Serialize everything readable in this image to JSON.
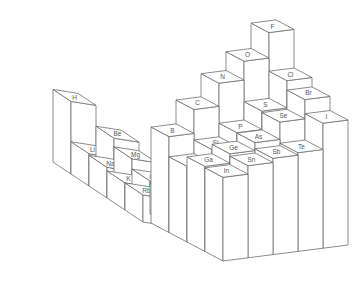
{
  "chart_data": {
    "type": "bar3d",
    "title": "",
    "quantity": "Electronegativity (Pauling scale, implied by bar heights)",
    "grid": false,
    "legend": null,
    "blocks": [
      {
        "name": "s-block",
        "columns": [
          "Group 1",
          "Group 2"
        ],
        "rows": [
          "Period 1",
          "Period 2",
          "Period 3",
          "Period 4",
          "Period 5"
        ],
        "bars": [
          {
            "symbol": "H",
            "row": 0,
            "col": 0,
            "value": 2.2
          },
          {
            "symbol": "Li",
            "row": 1,
            "col": 0,
            "value": 0.98
          },
          {
            "symbol": "Be",
            "row": 1,
            "col": 1,
            "value": 1.57
          },
          {
            "symbol": "Na",
            "row": 2,
            "col": 0,
            "value": 0.93
          },
          {
            "symbol": "Mg",
            "row": 2,
            "col": 1,
            "value": 1.31
          },
          {
            "symbol": "K",
            "row": 3,
            "col": 0,
            "value": 0.82
          },
          {
            "symbol": "Ca",
            "row": 3,
            "col": 1,
            "value": 1.0
          },
          {
            "symbol": "Rb",
            "row": 4,
            "col": 0,
            "value": 0.82
          },
          {
            "symbol": "Sr",
            "row": 4,
            "col": 1,
            "value": 0.95
          }
        ]
      },
      {
        "name": "p-block",
        "columns": [
          "Group 13",
          "Group 14",
          "Group 15",
          "Group 16",
          "Group 17"
        ],
        "rows": [
          "Period 2",
          "Period 3",
          "Period 4",
          "Period 5"
        ],
        "bars": [
          {
            "symbol": "B",
            "row": 0,
            "col": 0,
            "value": 2.04
          },
          {
            "symbol": "C",
            "row": 0,
            "col": 1,
            "value": 2.55
          },
          {
            "symbol": "N",
            "row": 0,
            "col": 2,
            "value": 3.04
          },
          {
            "symbol": "O",
            "row": 0,
            "col": 3,
            "value": 3.44
          },
          {
            "symbol": "F",
            "row": 0,
            "col": 4,
            "value": 3.98
          },
          {
            "symbol": "Al",
            "row": 1,
            "col": 0,
            "value": 1.61
          },
          {
            "symbol": "Si",
            "row": 1,
            "col": 1,
            "value": 1.9
          },
          {
            "symbol": "P",
            "row": 1,
            "col": 2,
            "value": 2.19
          },
          {
            "symbol": "S",
            "row": 1,
            "col": 3,
            "value": 2.58
          },
          {
            "symbol": "Cl",
            "row": 1,
            "col": 4,
            "value": 3.16
          },
          {
            "symbol": "Ga",
            "row": 2,
            "col": 0,
            "value": 1.81
          },
          {
            "symbol": "Ge",
            "row": 2,
            "col": 1,
            "value": 2.01
          },
          {
            "symbol": "As",
            "row": 2,
            "col": 2,
            "value": 2.18
          },
          {
            "symbol": "Se",
            "row": 2,
            "col": 3,
            "value": 2.55
          },
          {
            "symbol": "Br",
            "row": 2,
            "col": 4,
            "value": 2.96
          },
          {
            "symbol": "In",
            "row": 3,
            "col": 0,
            "value": 1.78
          },
          {
            "symbol": "Sn",
            "row": 3,
            "col": 1,
            "value": 1.96
          },
          {
            "symbol": "Sb",
            "row": 3,
            "col": 2,
            "value": 2.05
          },
          {
            "symbol": "Te",
            "row": 3,
            "col": 3,
            "value": 2.1
          },
          {
            "symbol": "I",
            "row": 3,
            "col": 4,
            "value": 2.66
          }
        ]
      }
    ]
  },
  "layout": {
    "blocks": [
      {
        "origin_x": 53,
        "origin_y": 162,
        "col_dx": 25,
        "col_dy": 4,
        "row_dx": 18,
        "row_dy": 12,
        "unit_px": 33
      },
      {
        "origin_x": 151,
        "origin_y": 223,
        "col_dx": 25,
        "col_dy": -3.2,
        "row_dx": 18,
        "row_dy": 9.5,
        "unit_px": 47
      }
    ],
    "stroke": "#6e6e6e",
    "label_color": "#555555"
  }
}
